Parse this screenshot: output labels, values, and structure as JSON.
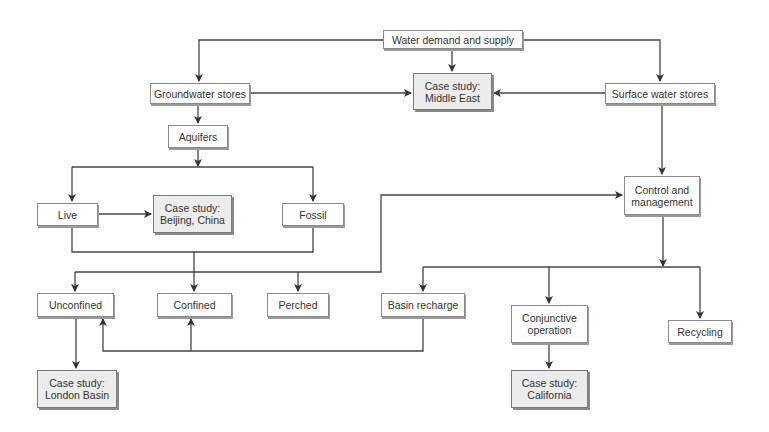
{
  "diagram": {
    "nodes": {
      "water_demand": "Water demand and supply",
      "groundwater": "Groundwater stores",
      "middle_east": "Case study:\nMiddle East",
      "surface_water": "Surface water stores",
      "aquifers": "Aquifers",
      "live": "Live",
      "beijing": "Case study:\nBeijing, China",
      "fossil": "Fossil",
      "control": "Control and\nmanagement",
      "unconfined": "Unconfined",
      "confined": "Confined",
      "perched": "Perched",
      "basin_recharge": "Basin recharge",
      "conjunctive": "Conjunctive\noperation",
      "recycling": "Recycling",
      "london": "Case study:\nLondon Basin",
      "california": "Case study:\nCalifornia"
    },
    "edges": [
      [
        "water_demand",
        "groundwater"
      ],
      [
        "water_demand",
        "middle_east"
      ],
      [
        "water_demand",
        "surface_water"
      ],
      [
        "groundwater",
        "middle_east"
      ],
      [
        "surface_water",
        "middle_east"
      ],
      [
        "groundwater",
        "aquifers"
      ],
      [
        "aquifers",
        "live"
      ],
      [
        "aquifers",
        "fossil"
      ],
      [
        "live",
        "beijing"
      ],
      [
        "live",
        "unconfined"
      ],
      [
        "live",
        "confined"
      ],
      [
        "live",
        "perched"
      ],
      [
        "live",
        "control"
      ],
      [
        "fossil",
        "unconfined"
      ],
      [
        "fossil",
        "confined"
      ],
      [
        "fossil",
        "perched"
      ],
      [
        "fossil",
        "control"
      ],
      [
        "surface_water",
        "control"
      ],
      [
        "control",
        "basin_recharge"
      ],
      [
        "control",
        "conjunctive"
      ],
      [
        "control",
        "recycling"
      ],
      [
        "basin_recharge",
        "unconfined"
      ],
      [
        "basin_recharge",
        "confined"
      ],
      [
        "unconfined",
        "london"
      ],
      [
        "conjunctive",
        "california"
      ]
    ]
  }
}
